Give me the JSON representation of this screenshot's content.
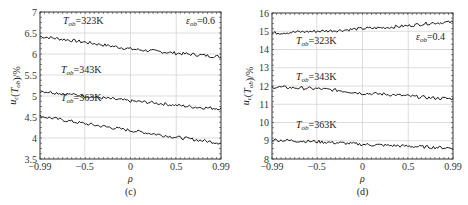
{
  "chart_data": [
    {
      "type": "line",
      "panel": "(c)",
      "caption": "(c)",
      "xlabel": "ρ",
      "ylabel": "u_c(T_ob)/%",
      "xlim": [
        -0.99,
        0.99
      ],
      "ylim": [
        3.5,
        7
      ],
      "xticks": [
        "-0.99",
        "-0.5",
        "0",
        "0.5",
        "0.99"
      ],
      "yticks": [
        "3.5",
        "4",
        "4.5",
        "5",
        "5.5",
        "6",
        "6.5",
        "7"
      ],
      "grid": true,
      "annotation": "ε_ob=0.6",
      "x": [
        -0.99,
        -0.75,
        -0.5,
        -0.25,
        0,
        0.25,
        0.5,
        0.75,
        0.99
      ],
      "series": [
        {
          "name": "T_ob=323K",
          "label": "T",
          "sub": "ob",
          "rest": "=323K",
          "values": [
            6.42,
            6.35,
            6.28,
            6.2,
            6.12,
            6.07,
            6.02,
            5.98,
            5.93
          ]
        },
        {
          "name": "T_ob=343K",
          "label": "T",
          "sub": "ob",
          "rest": "=343K",
          "values": [
            5.12,
            5.06,
            5.0,
            4.94,
            4.88,
            4.84,
            4.78,
            4.73,
            4.7
          ]
        },
        {
          "name": "T_ob=363K",
          "label": "T",
          "sub": "ob",
          "rest": "=363K",
          "values": [
            4.52,
            4.43,
            4.34,
            4.26,
            4.18,
            4.1,
            4.02,
            3.95,
            3.88
          ]
        }
      ]
    },
    {
      "type": "line",
      "panel": "(d)",
      "caption": "(d)",
      "xlabel": "ρ",
      "ylabel": "u_c(T_ob)/%",
      "xlim": [
        -0.99,
        0.99
      ],
      "ylim": [
        8,
        16
      ],
      "xticks": [
        "-0.99",
        "-0.5",
        "0",
        "0.5",
        "0.99"
      ],
      "yticks": [
        "8",
        "9",
        "10",
        "11",
        "12",
        "13",
        "14",
        "15",
        "16"
      ],
      "grid": true,
      "annotation": "ε_ob=0.4",
      "x": [
        -0.99,
        -0.75,
        -0.5,
        -0.25,
        0,
        0.25,
        0.5,
        0.75,
        0.99
      ],
      "series": [
        {
          "name": "T_ob=323K",
          "label": "T",
          "sub": "ob",
          "rest": "=323K",
          "values": [
            14.9,
            14.95,
            15.0,
            15.05,
            15.15,
            15.2,
            15.3,
            15.45,
            15.5
          ]
        },
        {
          "name": "T_ob=343K",
          "label": "T",
          "sub": "ob",
          "rest": "=343K",
          "values": [
            11.95,
            11.9,
            11.85,
            11.75,
            11.6,
            11.55,
            11.45,
            11.35,
            11.3
          ]
        },
        {
          "name": "T_ob=363K",
          "label": "T",
          "sub": "ob",
          "rest": "=363K",
          "values": [
            9.05,
            9.0,
            8.95,
            8.88,
            8.8,
            8.75,
            8.7,
            8.65,
            8.6
          ]
        }
      ]
    }
  ],
  "labels": {
    "ylabel_main": "u",
    "ylabel_sub": "c",
    "ylabel_paren_open": "(",
    "ylabel_T": "T",
    "ylabel_T_sub": "ob",
    "ylabel_tail": ")/%",
    "eps_symbol": "ε",
    "eps_sub": "ob",
    "eps_c": "=0.6",
    "eps_d": "=0.4"
  }
}
